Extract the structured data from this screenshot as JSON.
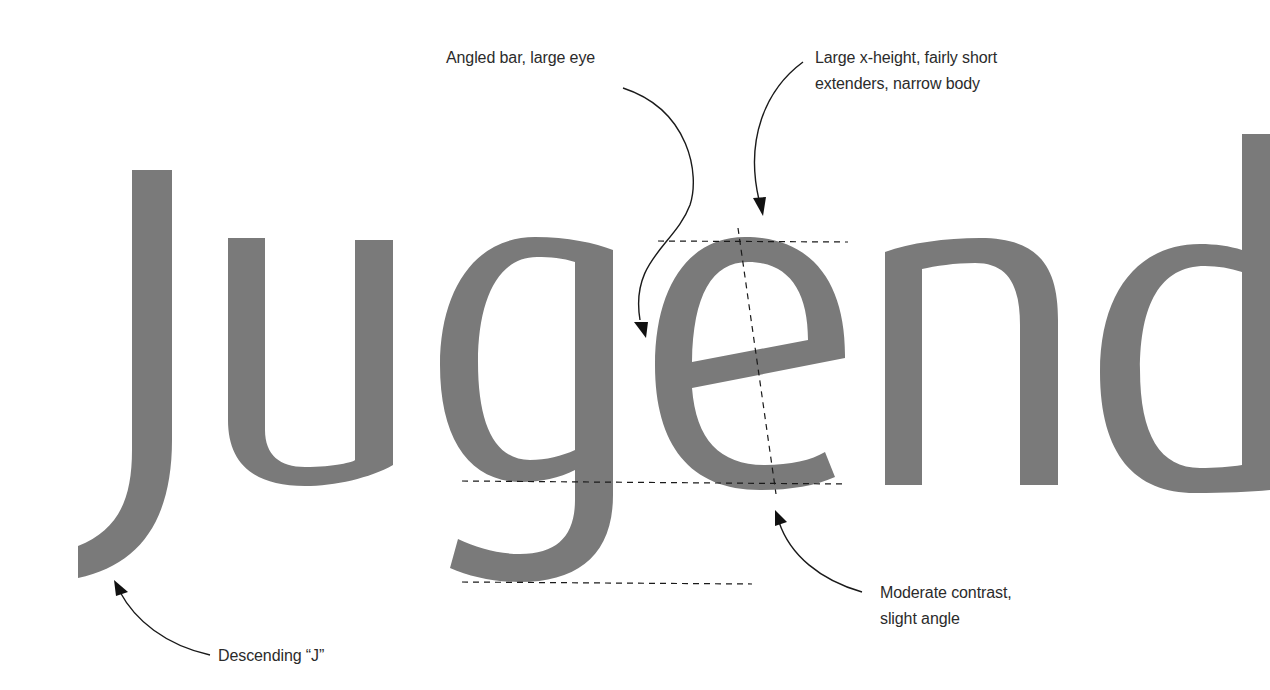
{
  "specimen": {
    "word": "Jugend",
    "glyph_color": "#7a7a7a",
    "guide_color": "#1a1a1a",
    "text_color": "#2b2b2b",
    "background": "#ffffff"
  },
  "annotations": {
    "bar": {
      "lines": [
        "Angled bar, large eye"
      ],
      "target": "crossbar of 'e'"
    },
    "xheight": {
      "lines": [
        "Large x-height, fairly short",
        "extenders, narrow body"
      ],
      "target": "x-height line above 'e'"
    },
    "descender_j": {
      "lines": [
        "Descending “J”"
      ],
      "target": "tail of 'J'"
    },
    "contrast": {
      "lines": [
        "Moderate contrast,",
        "slight angle"
      ],
      "target": "stress axis of 'e'"
    }
  },
  "guides": {
    "x_height_line": "x-height",
    "baseline": "baseline",
    "descender_line": "descender",
    "stress_axis": "stress axis"
  }
}
